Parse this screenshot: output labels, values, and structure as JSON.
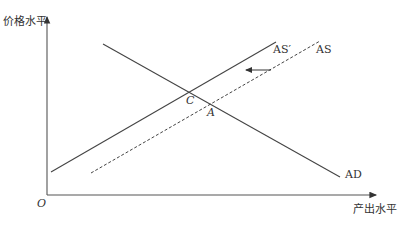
{
  "axes": {
    "y_label": "价格水平",
    "x_label": "产出水平",
    "origin": "O"
  },
  "curves": {
    "as_new": "AS′",
    "as_old": "AS",
    "ad": "AD"
  },
  "points": {
    "c": "C",
    "a": "A"
  },
  "colors": {
    "line": "#444444",
    "text": "#333333"
  }
}
